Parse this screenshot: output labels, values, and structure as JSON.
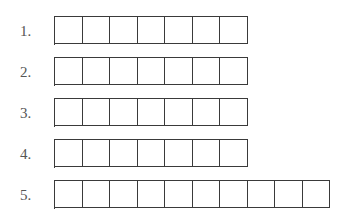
{
  "worksheet": {
    "rows": [
      {
        "label": "1.",
        "box_count": 7,
        "values": [
          "",
          "",
          "",
          "",
          "",
          "",
          ""
        ]
      },
      {
        "label": "2.",
        "box_count": 7,
        "values": [
          "",
          "",
          "",
          "",
          "",
          "",
          ""
        ]
      },
      {
        "label": "3.",
        "box_count": 7,
        "values": [
          "",
          "",
          "",
          "",
          "",
          "",
          ""
        ]
      },
      {
        "label": "4.",
        "box_count": 7,
        "values": [
          "",
          "",
          "",
          "",
          "",
          "",
          ""
        ]
      },
      {
        "label": "5.",
        "box_count": 10,
        "values": [
          "",
          "",
          "",
          "",
          "",
          "",
          "",
          "",
          "",
          ""
        ]
      }
    ]
  }
}
